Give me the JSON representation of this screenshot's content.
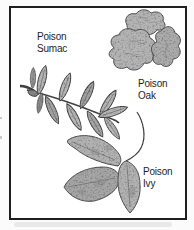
{
  "figure": {
    "labels": {
      "sumac": "Poison\nSumac",
      "oak": "Poison\nOak",
      "ivy": "Poison\nIvy"
    },
    "illustrations": {
      "sumac": "poison-sumac-compound-leaf-drawing",
      "oak": "poison-oak-leaf-cluster-drawing",
      "ivy": "poison-ivy-three-leaflet-drawing"
    },
    "colors": {
      "background": "#fbfbfb",
      "frame_border": "#1f1f1f",
      "frame_fill": "#ffffff",
      "leaf_fill": "#b5b5b5",
      "leaf_outline": "#474747",
      "label_text": "#1e1e1e"
    }
  }
}
